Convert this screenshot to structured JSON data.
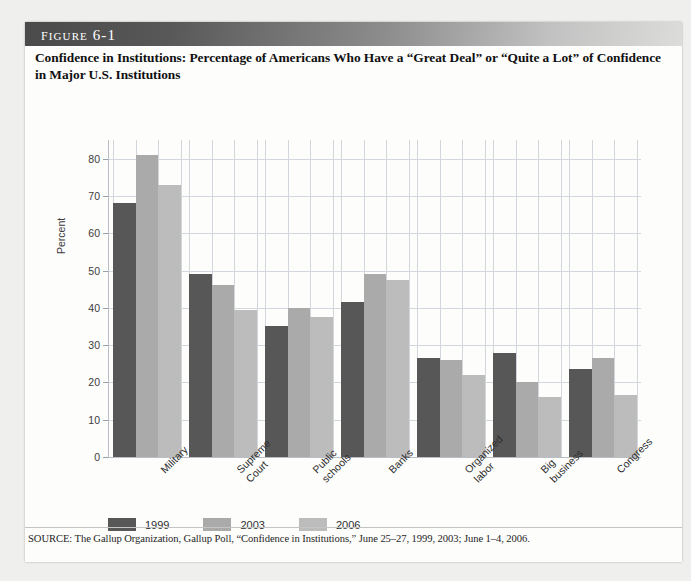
{
  "figure": {
    "number": "Figure 6-1",
    "title": "Confidence in Institutions: Percentage of Americans Who Have a “Great Deal” or “Quite a Lot” of Confidence in Major U.S. Institutions",
    "source": "SOURCE: The Gallup Organization, Gallup Poll, “Confidence in Institutions,” June 25–27, 1999, 2003; June 1–4, 2006."
  },
  "colors": {
    "series_1999": "#575757",
    "series_2003": "#aaaaaa",
    "series_2006": "#bcbcbc",
    "grid": "#d2d6dd",
    "axis": "#b9bdc4",
    "header_dark": "#4a4a4a",
    "header_light": "#dcdcda"
  },
  "chart_data": {
    "type": "bar",
    "title": "Confidence in Institutions: Percentage of Americans Who Have a “Great Deal” or “Quite a Lot” of Confidence in Major U.S. Institutions",
    "xlabel": "",
    "ylabel": "Percent",
    "ylim": [
      0,
      85
    ],
    "yticks": [
      0,
      10,
      20,
      30,
      40,
      50,
      60,
      70,
      80
    ],
    "ytick_labels": [
      "0",
      "10",
      "20",
      "30",
      "40",
      "50",
      "60",
      "70",
      "80"
    ],
    "grid": true,
    "legend_position": "bottom-left",
    "categories": [
      "Military",
      "Supreme Court",
      "Public schools",
      "Banks",
      "Organized labor",
      "Big business",
      "Congress"
    ],
    "category_lines": [
      [
        "Military"
      ],
      [
        "Supreme",
        "Court"
      ],
      [
        "Public",
        "schools"
      ],
      [
        "Banks"
      ],
      [
        "Organized",
        "labor"
      ],
      [
        "Big",
        "business"
      ],
      [
        "Congress"
      ]
    ],
    "series": [
      {
        "name": "1999",
        "color": "#575757",
        "values": [
          68,
          49,
          35,
          41.5,
          26.5,
          28,
          23.5
        ]
      },
      {
        "name": "2003",
        "color": "#aaaaaa",
        "values": [
          81,
          46,
          40,
          49,
          26,
          20,
          26.5
        ]
      },
      {
        "name": "2006",
        "color": "#bcbcbc",
        "values": [
          73,
          39.5,
          37.5,
          47.5,
          22,
          16,
          16.5
        ]
      }
    ]
  },
  "legend": {
    "items": [
      {
        "label": "1999",
        "color": "#575757"
      },
      {
        "label": "2003",
        "color": "#aaaaaa"
      },
      {
        "label": "2006",
        "color": "#bcbcbc"
      }
    ]
  }
}
